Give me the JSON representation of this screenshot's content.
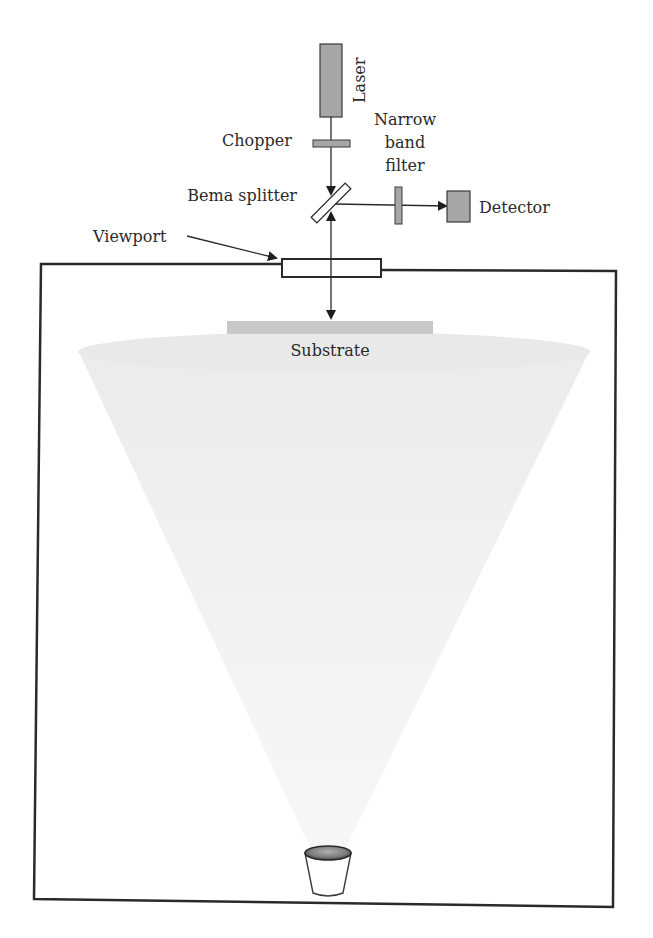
{
  "diagram": {
    "type": "laser reflectometry setup in deposition chamber",
    "labels": {
      "laser": "Laser",
      "chopper": "Chopper",
      "narrow_band_filter": [
        "Narrow",
        "band",
        "filter"
      ],
      "beam_splitter": "Bema splitter",
      "detector": "Detector",
      "viewport": "Viewport",
      "substrate": "Substrate"
    },
    "components": [
      {
        "name": "laser",
        "shape": "rect",
        "fill": "#a6a6a6"
      },
      {
        "name": "chopper",
        "shape": "rect",
        "fill": "#a6a6a6"
      },
      {
        "name": "beam-splitter",
        "shape": "tilted-rect",
        "fill": "#ffffff"
      },
      {
        "name": "narrow-band-filter",
        "shape": "rect",
        "fill": "#a6a6a6"
      },
      {
        "name": "detector",
        "shape": "rect",
        "fill": "#a6a6a6"
      },
      {
        "name": "viewport",
        "shape": "rect",
        "fill": "#ffffff"
      },
      {
        "name": "substrate",
        "shape": "rect",
        "fill": "#c8c8c8"
      },
      {
        "name": "vapor-plume",
        "shape": "cone",
        "fill": "#f0f0f0"
      },
      {
        "name": "crucible",
        "shape": "cup",
        "fill": "#ffffff"
      }
    ],
    "colors": {
      "line": "#2a2a2a",
      "component_gray": "#a6a6a6",
      "substrate_gray": "#c8c8c8",
      "plume": "#eeeeee",
      "background": "#ffffff"
    }
  }
}
